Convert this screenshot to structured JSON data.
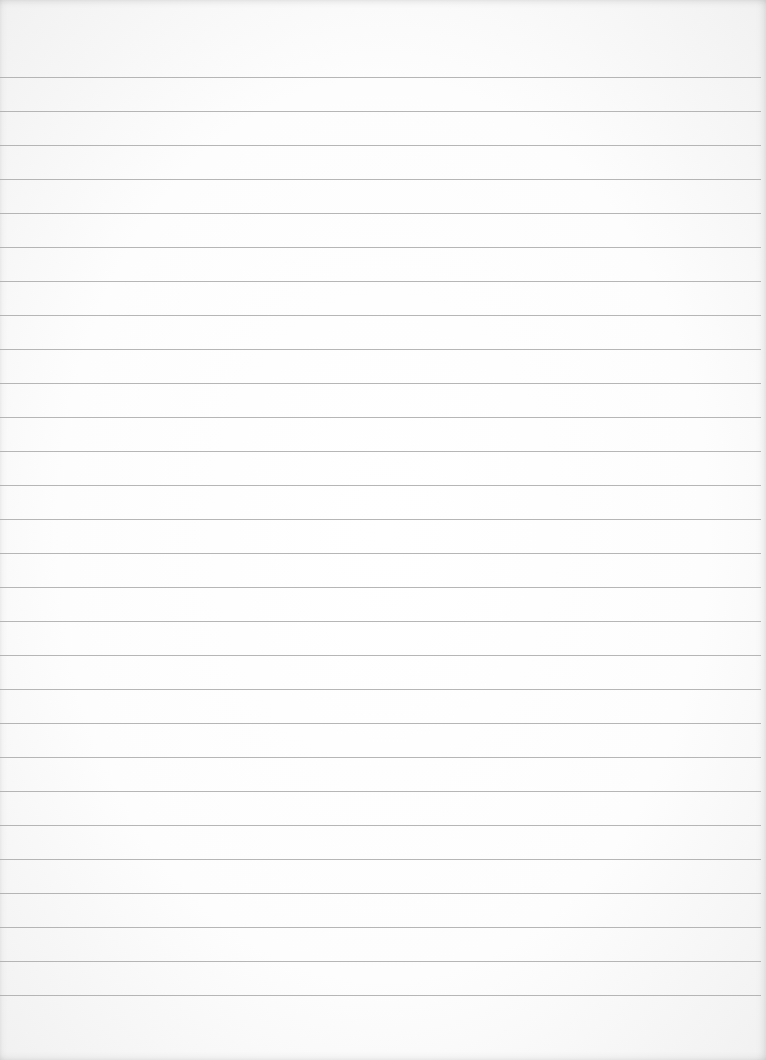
{
  "document": {
    "type": "lined-paper",
    "content_text": "",
    "paper_color": "#fdfdfd",
    "rule_color": "#a9a9a9",
    "rules": {
      "count": 28,
      "first_y": 77,
      "spacing": 34,
      "left": 0,
      "right_inset": 5
    }
  }
}
